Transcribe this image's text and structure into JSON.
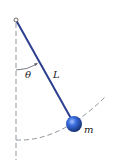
{
  "diagram": {
    "type": "simple-pendulum",
    "labels": {
      "angle": "θ",
      "length": "L",
      "mass": "m"
    },
    "colors": {
      "rod": "#2c3f8f",
      "bob_light": "#8fb0f5",
      "bob_mid": "#2f5fd6",
      "bob_dark": "#12307a",
      "dashed": "#9aa3ad",
      "arc": "#555a66"
    }
  }
}
